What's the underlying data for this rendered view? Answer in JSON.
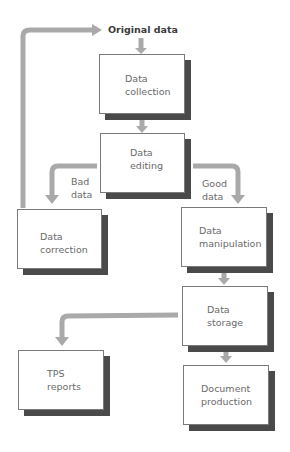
{
  "diagram": {
    "type": "flowchart",
    "start_label": "Original data",
    "nodes": [
      {
        "id": "collection",
        "line1": "Data",
        "line2": "collection"
      },
      {
        "id": "editing",
        "line1": "Data",
        "line2": "editing"
      },
      {
        "id": "correction",
        "line1": "Data",
        "line2": "correction"
      },
      {
        "id": "manipulation",
        "line1": "Data",
        "line2": "manipulation"
      },
      {
        "id": "storage",
        "line1": "Data",
        "line2": "storage"
      },
      {
        "id": "tps",
        "line1": "TPS",
        "line2": "reports"
      },
      {
        "id": "document",
        "line1": "Document",
        "line2": "production"
      }
    ],
    "edge_labels": {
      "bad": {
        "line1": "Bad",
        "line2": "data"
      },
      "good": {
        "line1": "Good",
        "line2": "data"
      }
    },
    "edges": [
      {
        "from": "Original data",
        "to": "collection"
      },
      {
        "from": "collection",
        "to": "editing"
      },
      {
        "from": "editing",
        "to": "correction",
        "label": "Bad data"
      },
      {
        "from": "editing",
        "to": "manipulation",
        "label": "Good data"
      },
      {
        "from": "correction",
        "to": "Original data"
      },
      {
        "from": "manipulation",
        "to": "storage"
      },
      {
        "from": "storage",
        "to": "tps"
      },
      {
        "from": "storage",
        "to": "document"
      }
    ],
    "colors": {
      "arrow": "#a8a8a8",
      "shadow": "#4a4a4a",
      "border": "#7a7a7a",
      "text": "#6a6a6a"
    }
  }
}
